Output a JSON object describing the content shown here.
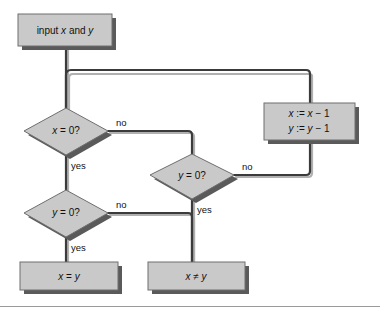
{
  "diagram": {
    "nodes": {
      "input": {
        "label": "input x and y"
      },
      "cond_x_zero": {
        "label": "x = 0?"
      },
      "cond_y_zero_left": {
        "label": "y = 0?"
      },
      "cond_y_zero_right": {
        "label": "y = 0?"
      },
      "decrement": {
        "line1": "x := x − 1",
        "line2": "y := y − 1"
      },
      "result_equal": {
        "label": "x = y"
      },
      "result_not_equal": {
        "label": "x ≠ y"
      }
    },
    "edge_labels": {
      "x_zero_no": "no",
      "x_zero_yes": "yes",
      "y_zero_left_no": "no",
      "y_zero_left_yes": "yes",
      "y_zero_right_no": "no",
      "y_zero_right_yes": "yes"
    },
    "colors": {
      "node_fill": "#c9c9c9",
      "node_border": "#6e6e6e",
      "node_shadow": "#5a5a5a",
      "connector": "#3b3b3b",
      "connector_shadow": "#b0b0b0",
      "text": "#111111",
      "background": "#ffffff",
      "frame_rule": "#9a9a9a"
    }
  }
}
